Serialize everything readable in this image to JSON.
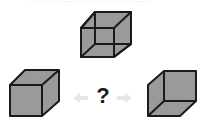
{
  "puzzle": {
    "caption": "……………………………………",
    "question_mark": "?",
    "arrow_left": "←",
    "arrow_right": "→",
    "figures": [
      {
        "id": "top",
        "label": "wireframe-cube",
        "fill": "#9a9a9a",
        "stroke": "#1a1a1a"
      },
      {
        "id": "left",
        "label": "solid-cube-view-1",
        "fill": "#9a9a9a",
        "stroke": "#1a1a1a"
      },
      {
        "id": "right",
        "label": "solid-cube-view-2",
        "fill": "#9a9a9a",
        "stroke": "#1a1a1a"
      }
    ],
    "colors": {
      "cube_fill": "#9a9a9a",
      "edge": "#1a1a1a",
      "arrow": "#e6e6e6",
      "text": "#1a1a1a"
    }
  }
}
